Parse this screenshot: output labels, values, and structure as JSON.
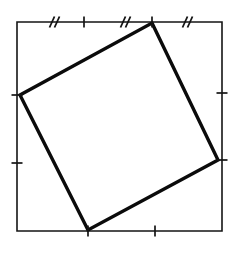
{
  "figure": {
    "caption": "",
    "canvas": {
      "width": 239,
      "height": 253,
      "background": "#ffffff"
    },
    "ink_color": "#111111",
    "outer_square": {
      "name": "outer-square",
      "stroke": "#151515",
      "stroke_width": 1.6,
      "fill": "none",
      "corners": [
        {
          "label": "top-left",
          "x": 17,
          "y": 22
        },
        {
          "label": "top-right",
          "x": 222,
          "y": 22
        },
        {
          "label": "bottom-right",
          "x": 222,
          "y": 231
        },
        {
          "label": "bottom-left",
          "x": 17,
          "y": 231
        }
      ]
    },
    "inner_square": {
      "name": "inner-square",
      "stroke": "#0b0b0b",
      "stroke_width": 3.4,
      "fill": "#ffffff",
      "vertices": [
        {
          "label": "top",
          "x": 152,
          "y": 23
        },
        {
          "label": "right",
          "x": 218,
          "y": 160
        },
        {
          "label": "bottom",
          "x": 88,
          "y": 230
        },
        {
          "label": "left",
          "x": 20,
          "y": 95
        }
      ]
    },
    "vertex_ticks": [
      {
        "name": "tick-top-vertex",
        "edge": "top",
        "x": 152,
        "y": 22,
        "orientation": "vertical",
        "length": 11
      },
      {
        "name": "tick-left-vertex",
        "edge": "left",
        "x": 17,
        "y": 95,
        "orientation": "horizontal",
        "length": 11
      },
      {
        "name": "tick-right-vertex",
        "edge": "right",
        "x": 222,
        "y": 160,
        "orientation": "horizontal",
        "length": 11
      },
      {
        "name": "tick-bottom-vertex",
        "edge": "bottom",
        "x": 88,
        "y": 231,
        "orientation": "vertical",
        "length": 11
      }
    ],
    "segment_ticks": [
      {
        "name": "tick-top-left-segment",
        "edge": "top",
        "x": 84,
        "y": 22,
        "orientation": "vertical",
        "length": 11
      },
      {
        "name": "tick-left-lower-segment",
        "edge": "left",
        "x": 17,
        "y": 163,
        "orientation": "horizontal",
        "length": 11
      },
      {
        "name": "tick-right-upper-segment",
        "edge": "right",
        "x": 222,
        "y": 93,
        "orientation": "horizontal",
        "length": 11
      },
      {
        "name": "tick-bottom-right-segment",
        "edge": "bottom",
        "x": 155,
        "y": 231,
        "orientation": "vertical",
        "length": 11
      }
    ],
    "hatch_marks": [
      {
        "name": "hatch-top-first",
        "edge": "top",
        "x": 52,
        "y": 22,
        "strokes": 2,
        "symbol": "//"
      },
      {
        "name": "hatch-top-second",
        "edge": "top",
        "x": 123,
        "y": 22,
        "strokes": 2,
        "symbol": "//"
      },
      {
        "name": "hatch-top-third",
        "edge": "top",
        "x": 185,
        "y": 22,
        "strokes": 2,
        "symbol": "//"
      }
    ]
  }
}
